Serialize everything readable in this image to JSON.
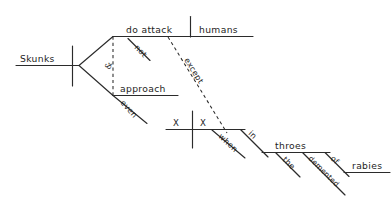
{
  "diagram": {
    "kind": "reed-kellogg-sentence-diagram",
    "sentence": "Skunks do not attack humans, except when X X in the demented throes of rabies, and even approach.",
    "ink_color": "#2b2b2b",
    "background_color": "#ffffff",
    "labels": {
      "subject": "Skunks",
      "conjunction": "&",
      "predicate_upper": "do attack",
      "predicate_upper_modifier": "not",
      "direct_object": "humans",
      "predicate_lower": "approach",
      "predicate_lower_modifier": "even",
      "subordinator": "except",
      "elided_subject": "X",
      "elided_verb": "X",
      "subordinate_conjunction": "when",
      "preposition_in": "in",
      "prep_object_throes": "throes",
      "article_the": "the",
      "adjective_demented": "demented",
      "preposition_of": "of",
      "prep_object_rabies": "rabies"
    }
  }
}
